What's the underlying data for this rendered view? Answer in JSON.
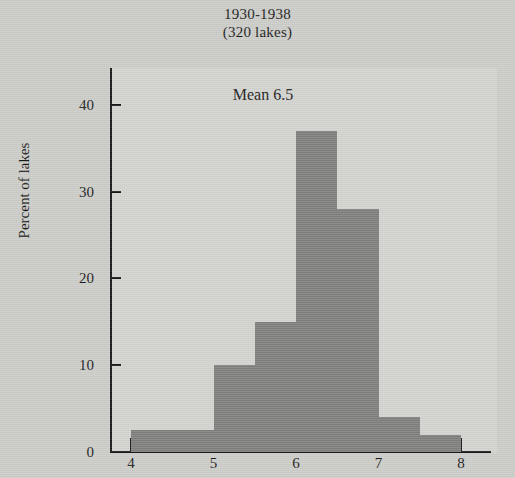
{
  "title": {
    "line1": "1930-1938",
    "line2": "(320 lakes)"
  },
  "annotation": {
    "mean_label": "Mean 6.5"
  },
  "axes": {
    "y_title": "Percent of lakes",
    "y_ticks": [
      "0",
      "10",
      "20",
      "30",
      "40"
    ],
    "x_ticks": [
      "4",
      "5",
      "6",
      "7",
      "8"
    ]
  },
  "colors": {
    "page_background": "#cbcbc7",
    "plot_background": "#d2d2ce",
    "bar_fill": "#7e7e7c",
    "axis": "#171717",
    "text": "#1a1a1a"
  },
  "chart_data": {
    "type": "bar",
    "title": "1930-1938 (320 lakes)",
    "subtitle": "(320 lakes)",
    "xlabel": "",
    "ylabel": "Percent of lakes",
    "xlim": [
      3.6,
      8.3
    ],
    "ylim": [
      0,
      45
    ],
    "ytick_values": [
      0,
      10,
      20,
      30,
      40
    ],
    "xtick_values": [
      4,
      5,
      6,
      7,
      8
    ],
    "grid": false,
    "legend": false,
    "annotations": [
      {
        "text": "Mean 6.5",
        "x": 5.6,
        "y": 41
      }
    ],
    "bin_width": 0.5,
    "bins": [
      {
        "left": 4.0,
        "right": 4.5,
        "value": 2.5
      },
      {
        "left": 4.5,
        "right": 5.0,
        "value": 2.5
      },
      {
        "left": 5.0,
        "right": 5.5,
        "value": 10.0
      },
      {
        "left": 5.5,
        "right": 6.0,
        "value": 15.0
      },
      {
        "left": 6.0,
        "right": 6.5,
        "value": 37.0
      },
      {
        "left": 6.5,
        "right": 7.0,
        "value": 28.0
      },
      {
        "left": 7.0,
        "right": 7.5,
        "value": 4.0
      },
      {
        "left": 7.5,
        "right": 8.0,
        "value": 2.0
      }
    ],
    "categories": [
      "4.0-4.5",
      "4.5-5.0",
      "5.0-5.5",
      "5.5-6.0",
      "6.0-6.5",
      "6.5-7.0",
      "7.0-7.5",
      "7.5-8.0"
    ],
    "values": [
      2.5,
      2.5,
      10.0,
      15.0,
      37.0,
      28.0,
      4.0,
      2.0
    ]
  }
}
